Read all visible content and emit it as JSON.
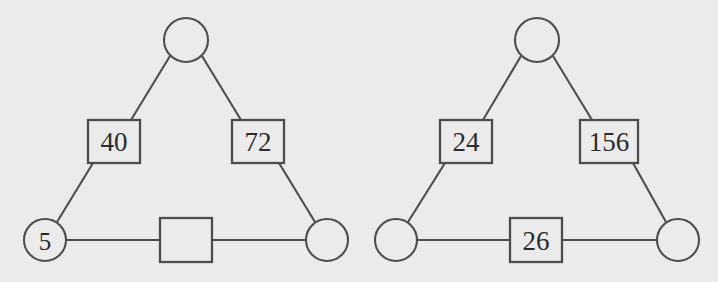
{
  "canvas": {
    "width": 718,
    "height": 282,
    "background_color": "#ebebeb",
    "stroke_color": "#4d4d4d",
    "text_color": "#2b2b2b"
  },
  "diagrams": [
    {
      "id": "left-triangle",
      "nodes": [
        {
          "id": "left-top-node",
          "label": "",
          "cx": 186,
          "cy": 40,
          "r": 22
        },
        {
          "id": "left-bottom-left-node",
          "label": "5",
          "cx": 45,
          "cy": 240,
          "r": 21
        },
        {
          "id": "left-bottom-right-node",
          "label": "",
          "cx": 327,
          "cy": 240,
          "r": 21
        }
      ],
      "edges": [
        {
          "id": "left-edge-upleft",
          "label": "40",
          "x": 88,
          "y": 120,
          "w": 52,
          "h": 43
        },
        {
          "id": "left-edge-upright",
          "label": "72",
          "x": 232,
          "y": 120,
          "w": 52,
          "h": 43
        },
        {
          "id": "left-edge-bottom",
          "label": "",
          "x": 160,
          "y": 218,
          "w": 52,
          "h": 44
        }
      ]
    },
    {
      "id": "right-triangle",
      "nodes": [
        {
          "id": "right-top-node",
          "label": "",
          "cx": 537,
          "cy": 40,
          "r": 22
        },
        {
          "id": "right-bottom-left-node",
          "label": "",
          "cx": 396,
          "cy": 240,
          "r": 21
        },
        {
          "id": "right-bottom-right-node",
          "label": "",
          "cx": 678,
          "cy": 240,
          "r": 21
        }
      ],
      "edges": [
        {
          "id": "right-edge-upleft",
          "label": "24",
          "x": 440,
          "y": 120,
          "w": 52,
          "h": 43
        },
        {
          "id": "right-edge-upright",
          "label": "156",
          "x": 580,
          "y": 120,
          "w": 58,
          "h": 43
        },
        {
          "id": "right-edge-bottom",
          "label": "26",
          "x": 510,
          "y": 218,
          "w": 52,
          "h": 44
        }
      ]
    }
  ]
}
